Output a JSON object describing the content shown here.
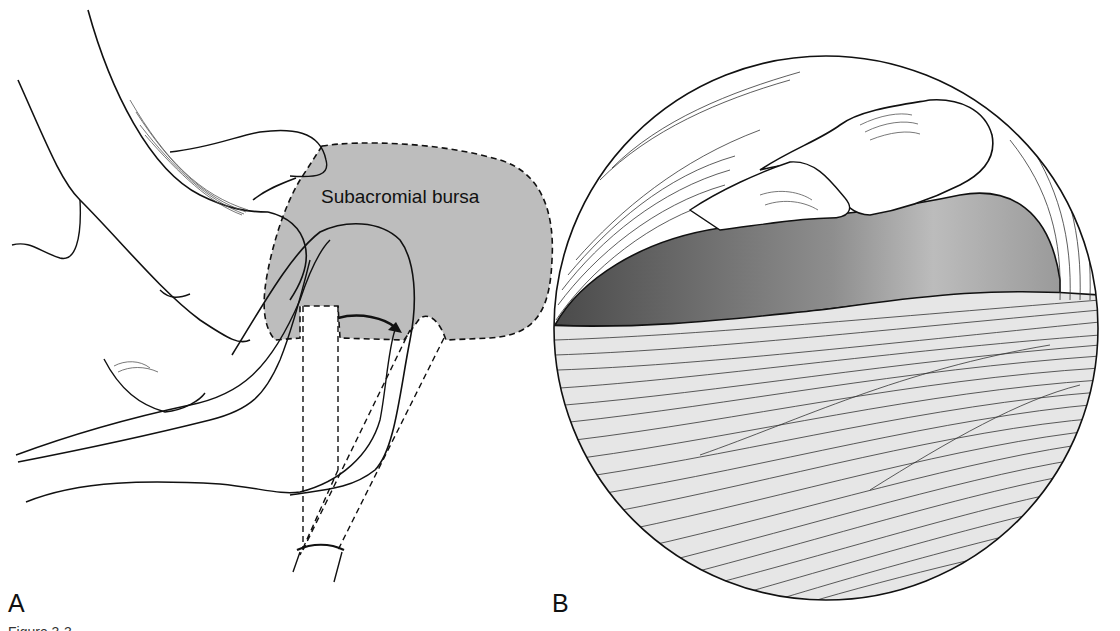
{
  "figure": {
    "panels": [
      {
        "id": "A",
        "label": "A",
        "description": "Lateral view of shoulder with arthroscope in subacromial bursa"
      },
      {
        "id": "B",
        "label": "B",
        "description": "Arthroscopic circular view of subacromial space and rotator cuff"
      }
    ],
    "annotations": {
      "bursa_label": "Subacromial bursa"
    },
    "caption_fragment": "Figure 3-3",
    "colors": {
      "bursa_fill": "#bdbdbd",
      "outline": "#111111",
      "cavity_dark": "#5a5a5a",
      "cavity_light": "#c8c8c8",
      "tendon_fill": "#e8e8e8"
    }
  }
}
